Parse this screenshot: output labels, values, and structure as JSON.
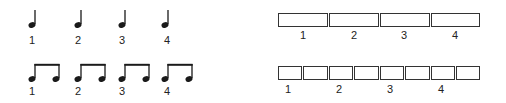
{
  "quarter_notes": {
    "description": "Four quarter notes, one per beat",
    "labels": [
      "1",
      "2",
      "3",
      "4"
    ]
  },
  "eighth_notes": {
    "description": "Four beamed eighth-note pairs, two per beat",
    "labels": [
      "1",
      "2",
      "3",
      "4"
    ]
  },
  "quarter_boxes": {
    "description": "Four equal boxes representing quarter-note beats",
    "count": 4,
    "labels": [
      "1",
      "2",
      "3",
      "4"
    ]
  },
  "eighth_boxes": {
    "description": "Eight equal boxes representing eighth-note subdivisions",
    "count": 8,
    "labels": [
      "1",
      "2",
      "3",
      "4"
    ]
  },
  "colors": {
    "ink": "#1a1a1a",
    "background": "#ffffff"
  }
}
